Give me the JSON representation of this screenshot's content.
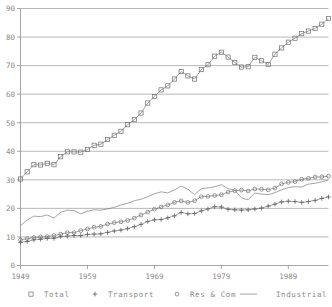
{
  "chart_data": {
    "type": "line",
    "title": "",
    "subtitle": "",
    "xlabel": "",
    "ylabel": "",
    "xlim": [
      1949,
      1995
    ],
    "ylim": [
      0,
      90
    ],
    "grid": true,
    "legend_position": "bottom",
    "y_ticks": [
      0,
      10,
      20,
      30,
      40,
      50,
      60,
      70,
      80,
      90
    ],
    "y_tick_labels": [
      "0",
      "10",
      "20",
      "30",
      "40",
      "50",
      "60",
      "70",
      "80",
      "90"
    ],
    "x_ticks": [
      1949,
      1959,
      1969,
      1979,
      1989
    ],
    "x_tick_labels": [
      "1949",
      "1959",
      "1969",
      "1979",
      "1989"
    ],
    "x": [
      1949,
      1950,
      1951,
      1952,
      1953,
      1954,
      1955,
      1956,
      1957,
      1958,
      1959,
      1960,
      1961,
      1962,
      1963,
      1964,
      1965,
      1966,
      1967,
      1968,
      1969,
      1970,
      1971,
      1972,
      1973,
      1974,
      1975,
      1976,
      1977,
      1978,
      1979,
      1980,
      1981,
      1982,
      1983,
      1984,
      1985,
      1986,
      1987,
      1988,
      1989,
      1990,
      1991,
      1992,
      1993,
      1994,
      1995
    ],
    "series": [
      {
        "name": "Total",
        "marker": "square",
        "values": [
          30.3,
          32.8,
          35.3,
          35.2,
          35.8,
          35.3,
          38.1,
          39.8,
          39.8,
          39.7,
          40.6,
          42.1,
          42.5,
          44.1,
          45.6,
          47.0,
          49.3,
          51.1,
          53.4,
          56.9,
          59.2,
          61.5,
          62.9,
          65.3,
          67.9,
          66.4,
          65.3,
          68.6,
          70.3,
          73.3,
          74.7,
          73.0,
          71.1,
          69.5,
          69.6,
          72.9,
          71.7,
          70.4,
          74.0,
          76.2,
          78.2,
          79.6,
          81.2,
          82.1,
          83.0,
          84.5,
          86.5
        ]
      },
      {
        "name": "Transport",
        "marker": "plus",
        "values": [
          8.1,
          8.4,
          9.0,
          9.2,
          9.5,
          9.5,
          10.1,
          10.3,
          10.5,
          10.5,
          10.9,
          11.0,
          11.1,
          11.6,
          12.1,
          12.4,
          12.9,
          13.6,
          14.4,
          15.4,
          16.0,
          16.1,
          16.7,
          17.4,
          18.6,
          18.1,
          18.2,
          19.1,
          19.8,
          20.6,
          20.5,
          19.7,
          19.5,
          19.4,
          19.5,
          19.8,
          20.1,
          20.8,
          21.5,
          22.3,
          22.5,
          22.4,
          22.1,
          22.4,
          22.8,
          23.5,
          24.0
        ]
      },
      {
        "name": "Res & Com",
        "marker": "circle",
        "values": [
          9.0,
          9.4,
          9.8,
          10.0,
          10.1,
          10.5,
          11.0,
          11.5,
          11.5,
          12.2,
          12.8,
          13.4,
          13.7,
          14.5,
          15.0,
          15.3,
          15.8,
          16.6,
          17.7,
          18.7,
          19.7,
          20.5,
          21.2,
          22.1,
          22.6,
          22.1,
          22.7,
          24.1,
          24.2,
          24.5,
          24.8,
          25.7,
          26.2,
          26.4,
          26.1,
          26.8,
          26.7,
          26.5,
          27.1,
          28.6,
          29.1,
          29.4,
          30.2,
          30.5,
          31.0,
          31.0,
          31.3
        ]
      },
      {
        "name": "Industrial",
        "marker": "none",
        "values": [
          14.0,
          15.9,
          17.3,
          17.1,
          17.7,
          16.6,
          18.6,
          19.4,
          19.2,
          18.1,
          19.0,
          19.5,
          19.4,
          19.8,
          20.4,
          21.2,
          21.8,
          22.7,
          23.2,
          24.1,
          25.1,
          25.8,
          25.4,
          26.5,
          27.8,
          26.7,
          24.8,
          26.9,
          27.2,
          27.6,
          28.3,
          26.9,
          26.4,
          23.7,
          23.0,
          25.4,
          25.0,
          24.8,
          25.5,
          26.5,
          27.3,
          27.6,
          27.5,
          28.5,
          28.8,
          29.3,
          30.0
        ]
      }
    ],
    "legend": [
      {
        "label": "Total",
        "marker": "square"
      },
      {
        "label": "Transport",
        "marker": "plus"
      },
      {
        "label": "Res & Com",
        "marker": "circle"
      },
      {
        "label": "Industrial",
        "marker": "line"
      }
    ],
    "colors": {
      "grid": "#9a9a9a",
      "axis": "#8f8f8f",
      "series": "#7d7d7d",
      "text": "#8a8a8a",
      "background": "#ffffff"
    }
  }
}
